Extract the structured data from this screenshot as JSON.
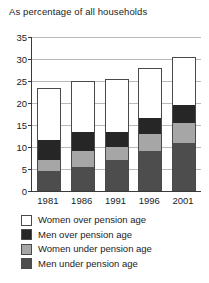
{
  "chart_data": {
    "type": "bar",
    "subtype": "stacked",
    "title": "As percentage of all households",
    "xlabel": "",
    "ylabel": "",
    "ylim": [
      0,
      35
    ],
    "ytick_step": 5,
    "yticks": [
      "0",
      "5",
      "10",
      "15",
      "20",
      "25",
      "30",
      "35"
    ],
    "grid": true,
    "legend_position": "below",
    "categories": [
      "1981",
      "1986",
      "1991",
      "1996",
      "2001"
    ],
    "series": [
      {
        "name": "Men under pension age",
        "color": "#4d4d4d",
        "values": [
          4.5,
          5.5,
          7.0,
          9.0,
          11.0
        ]
      },
      {
        "name": "Women under pension age",
        "color": "#a6a6a6",
        "values": [
          2.5,
          3.5,
          3.0,
          4.0,
          4.5
        ]
      },
      {
        "name": "Men over pension age",
        "color": "#262626",
        "values": [
          4.5,
          4.5,
          3.5,
          3.5,
          4.0
        ]
      },
      {
        "name": "Women over pension age",
        "color": "#ffffff",
        "values": [
          12.0,
          11.5,
          12.0,
          11.5,
          11.0
        ]
      }
    ],
    "totals": [
      23.5,
      25.0,
      25.5,
      28.0,
      30.5
    ]
  },
  "legend": {
    "items": [
      {
        "label": "Women over pension age",
        "color": "#ffffff"
      },
      {
        "label": "Men over pension age",
        "color": "#262626"
      },
      {
        "label": "Women under pension age",
        "color": "#a6a6a6"
      },
      {
        "label": "Men under pension age",
        "color": "#4d4d4d"
      }
    ]
  }
}
